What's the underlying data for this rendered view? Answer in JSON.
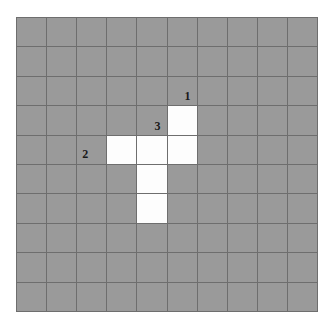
{
  "figure": {
    "type": "grid-diagram",
    "background_color": "#ffffff",
    "grid": {
      "columns": 10,
      "rows": 10,
      "empty_cell_color": "#9a9a9a",
      "filled_cell_color": "#fdfdfd",
      "gridline_color": "#6e6e6e",
      "filled_cells": [
        {
          "col": 5,
          "row": 3
        },
        {
          "col": 3,
          "row": 4
        },
        {
          "col": 4,
          "row": 4
        },
        {
          "col": 5,
          "row": 4
        },
        {
          "col": 4,
          "row": 5
        },
        {
          "col": 4,
          "row": 6
        }
      ],
      "labels": [
        {
          "text": "1",
          "col": 5,
          "row": 2,
          "align": "center"
        },
        {
          "text": "3",
          "col": 4,
          "row": 3,
          "align": "center"
        },
        {
          "text": "2",
          "col": 2,
          "row": 4,
          "align": "left"
        }
      ],
      "cell_matrix": [
        [
          0,
          0,
          0,
          0,
          0,
          0,
          0,
          0,
          0,
          0
        ],
        [
          0,
          0,
          0,
          0,
          0,
          0,
          0,
          0,
          0,
          0
        ],
        [
          0,
          0,
          0,
          0,
          0,
          0,
          0,
          0,
          0,
          0
        ],
        [
          0,
          0,
          0,
          0,
          0,
          1,
          0,
          0,
          0,
          0
        ],
        [
          0,
          0,
          0,
          1,
          1,
          1,
          0,
          0,
          0,
          0
        ],
        [
          0,
          0,
          0,
          0,
          1,
          0,
          0,
          0,
          0,
          0
        ],
        [
          0,
          0,
          0,
          0,
          1,
          0,
          0,
          0,
          0,
          0
        ],
        [
          0,
          0,
          0,
          0,
          0,
          0,
          0,
          0,
          0,
          0
        ],
        [
          0,
          0,
          0,
          0,
          0,
          0,
          0,
          0,
          0,
          0
        ],
        [
          0,
          0,
          0,
          0,
          0,
          0,
          0,
          0,
          0,
          0
        ]
      ]
    }
  }
}
